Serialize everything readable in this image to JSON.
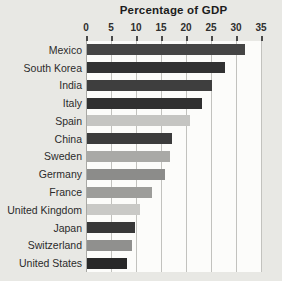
{
  "title": "Percentage of GDP",
  "chart_data": {
    "type": "bar",
    "orientation": "horizontal",
    "title": "Percentage of GDP",
    "categories": [
      "Mexico",
      "South Korea",
      "India",
      "Italy",
      "Spain",
      "China",
      "Sweden",
      "Germany",
      "France",
      "United Kingdom",
      "Japan",
      "Switzerland",
      "United States"
    ],
    "values": [
      31.5,
      27.5,
      25,
      23,
      20.5,
      17,
      16.5,
      15.5,
      13,
      10.5,
      9.5,
      9,
      8
    ],
    "bar_colors": [
      "#454545",
      "#323232",
      "#3e3e3e",
      "#303030",
      "#c5c5c2",
      "#3c3c3c",
      "#a9a9a6",
      "#8c8c8a",
      "#9d9d9a",
      "#c9c9c6",
      "#383838",
      "#90908e",
      "#282828"
    ],
    "xlabel": "Percentage of GDP",
    "ylabel": "",
    "xlim": [
      0,
      35
    ],
    "xticks": [
      0,
      5,
      10,
      15,
      20,
      25,
      30,
      35
    ],
    "grid": true,
    "legend": "none"
  },
  "colors": {
    "background": "#e8e8e4",
    "plot_background": "#fcfcfa",
    "gridline": "#c2c2be",
    "tick_mark": "#4a4a4a",
    "label_text": "#2b2b2b",
    "title_text": "#1c1c1c"
  }
}
